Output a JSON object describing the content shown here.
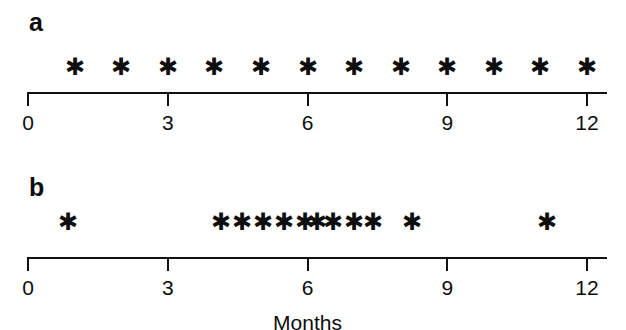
{
  "figure": {
    "background_color": "#ffffff",
    "ink_color": "#111111",
    "mark_glyph": "✱",
    "mark_glyph_name": "asterisk-marker"
  },
  "chart_data": {
    "type": "scatter",
    "title": "",
    "xlabel": "Months",
    "ylabel": "",
    "xlim": [
      0,
      12
    ],
    "xticks": [
      0,
      3,
      6,
      9,
      12
    ],
    "xtick_labels": [
      "0",
      "3",
      "6",
      "9",
      "12"
    ],
    "grid": false,
    "legend": null,
    "panels": [
      {
        "label": "a",
        "axis_title": "",
        "marker": "asterisk",
        "n_events": 12,
        "x": [
          1,
          2,
          3,
          4,
          5,
          6,
          7,
          8,
          9,
          10,
          11,
          12
        ]
      },
      {
        "label": "b",
        "axis_title": "Months",
        "marker": "asterisk",
        "n_events": 13,
        "x": [
          0.85,
          4.15,
          4.6,
          5.05,
          5.5,
          5.95,
          6.2,
          6.55,
          7.0,
          7.4,
          8.25,
          11.15
        ]
      }
    ]
  },
  "panel_a": {
    "label": "a",
    "axis": {
      "tick_labels": [
        "0",
        "3",
        "6",
        "9",
        "12"
      ],
      "tick_values": [
        0,
        3,
        6,
        9,
        12
      ],
      "title": ""
    },
    "marks": [
      {
        "month": 1,
        "glyph": "✱"
      },
      {
        "month": 2,
        "glyph": "✱"
      },
      {
        "month": 3,
        "glyph": "✱"
      },
      {
        "month": 4,
        "glyph": "✱"
      },
      {
        "month": 5,
        "glyph": "✱"
      },
      {
        "month": 6,
        "glyph": "✱"
      },
      {
        "month": 7,
        "glyph": "✱"
      },
      {
        "month": 8,
        "glyph": "✱"
      },
      {
        "month": 9,
        "glyph": "✱"
      },
      {
        "month": 10,
        "glyph": "✱"
      },
      {
        "month": 11,
        "glyph": "✱"
      },
      {
        "month": 12,
        "glyph": "✱"
      }
    ]
  },
  "panel_b": {
    "label": "b",
    "axis": {
      "tick_labels": [
        "0",
        "3",
        "6",
        "9",
        "12"
      ],
      "tick_values": [
        0,
        3,
        6,
        9,
        12
      ],
      "title": "Months"
    },
    "marks": [
      {
        "month": 0.85,
        "glyph": "✱"
      },
      {
        "month": 4.15,
        "glyph": "✱"
      },
      {
        "month": 4.6,
        "glyph": "✱"
      },
      {
        "month": 5.05,
        "glyph": "✱"
      },
      {
        "month": 5.5,
        "glyph": "✱"
      },
      {
        "month": 5.95,
        "glyph": "✱"
      },
      {
        "month": 6.2,
        "glyph": "✱"
      },
      {
        "month": 6.55,
        "glyph": "✱"
      },
      {
        "month": 7.0,
        "glyph": "✱"
      },
      {
        "month": 7.4,
        "glyph": "✱"
      },
      {
        "month": 8.25,
        "glyph": "✱"
      },
      {
        "month": 11.15,
        "glyph": "✱"
      }
    ]
  }
}
